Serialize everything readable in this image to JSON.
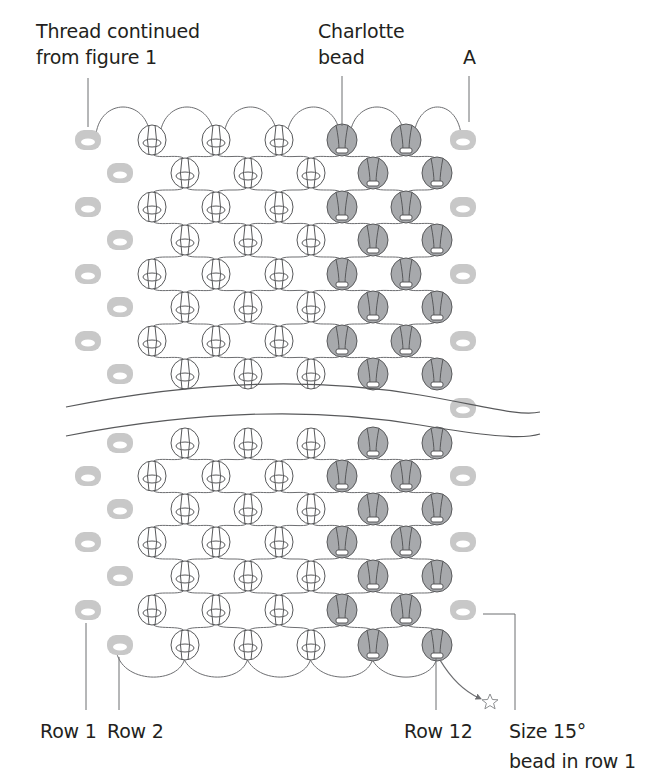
{
  "figure": {
    "labels": {
      "thread": {
        "line1": "Thread continued",
        "line2": "from figure 1"
      },
      "charlotte": {
        "line1": "Charlotte",
        "line2": "bead"
      },
      "point_a": "A",
      "row1": "Row 1",
      "row2": "Row 2",
      "row12": "Row 12",
      "size15": {
        "line1": "Size 15°",
        "line2": "bead in row 1"
      }
    },
    "colors": {
      "text": "#231f20",
      "thread": "#6d6e71",
      "end_bead": "#c8c8c8",
      "charlotte_fill": "#a7a9ac",
      "outline": "#58595b"
    },
    "grid": {
      "odd_row_columns_x": [
        152,
        216,
        279,
        342,
        406
      ],
      "even_row_columns_x": [
        185,
        248,
        311,
        373,
        437
      ],
      "charlotte_columns_odd": [
        3,
        4
      ],
      "charlotte_columns_even": [
        3,
        4
      ],
      "left_end_x_odd": 88,
      "left_end_x_even": 120,
      "right_end_x": 463,
      "upper_rows": [
        {
          "y": 140,
          "type": "odd"
        },
        {
          "y": 173,
          "type": "even"
        },
        {
          "y": 207,
          "type": "odd"
        },
        {
          "y": 240,
          "type": "even"
        },
        {
          "y": 274,
          "type": "odd"
        },
        {
          "y": 307,
          "type": "even"
        },
        {
          "y": 341,
          "type": "odd"
        },
        {
          "y": 374,
          "type": "even"
        }
      ],
      "lower_rows": [
        {
          "y": 443,
          "type": "even"
        },
        {
          "y": 476,
          "type": "odd"
        },
        {
          "y": 509,
          "type": "even"
        },
        {
          "y": 542,
          "type": "odd"
        },
        {
          "y": 576,
          "type": "even"
        },
        {
          "y": 610,
          "type": "odd"
        },
        {
          "y": 645,
          "type": "even"
        }
      ],
      "right_end_rows_y": [
        140,
        207,
        274,
        341,
        408,
        476,
        542,
        610
      ]
    },
    "end_marker": "star-icon"
  }
}
